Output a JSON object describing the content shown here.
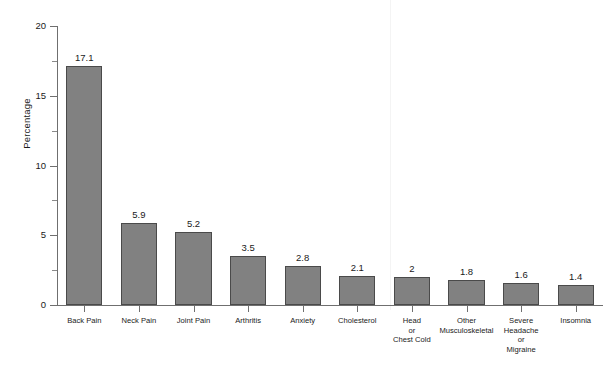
{
  "chart_data": {
    "type": "bar",
    "title": "",
    "xlabel": "",
    "ylabel": "Percentage",
    "ylim": [
      0,
      20
    ],
    "yticks": [
      0,
      5,
      10,
      15,
      20
    ],
    "ytick_labels": [
      "0",
      "5",
      "10",
      "15",
      "20"
    ],
    "minor_ticks": [
      2.5,
      7.5,
      12.5,
      17.5
    ],
    "grid": false,
    "legend": null,
    "bar_color": "#818181",
    "bar_edge_color": "#4a4a4a",
    "axis_color": "#6f6f6f",
    "background": "#ffffff",
    "categories": [
      "Back Pain",
      "Neck Pain",
      "Joint Pain",
      "Arthritis",
      "Anxiety",
      "Cholesterol",
      "Head or Chest Cold",
      "Other Musculoskeletal",
      "Severe Headache or Migraine",
      "Insomnia"
    ],
    "category_lines": [
      [
        "Back Pain"
      ],
      [
        "Neck Pain"
      ],
      [
        "Joint Pain"
      ],
      [
        "Arthritis"
      ],
      [
        "Anxiety"
      ],
      [
        "Cholesterol"
      ],
      [
        "Head",
        "or",
        "Chest Cold"
      ],
      [
        "Other",
        "Musculoskeletal"
      ],
      [
        "Severe",
        "Headache",
        "or",
        "Migraine"
      ],
      [
        "Insomnia"
      ]
    ],
    "values": [
      17.1,
      5.9,
      5.2,
      3.5,
      2.8,
      2.1,
      2.0,
      1.8,
      1.6,
      1.4
    ],
    "value_labels": [
      "17.1",
      "5.9",
      "5.2",
      "3.5",
      "2.8",
      "2.1",
      "2",
      "1.8",
      "1.6",
      "1.4"
    ]
  }
}
